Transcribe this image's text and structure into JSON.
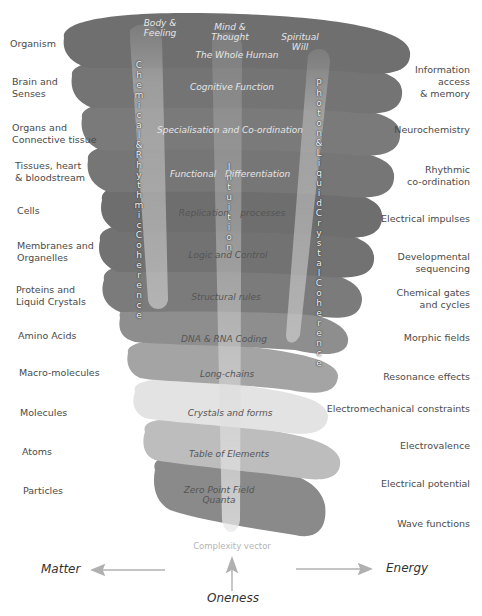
{
  "left_labels": [
    {
      "text": "Organism",
      "x": 10,
      "y": 38
    },
    {
      "text": "Brain and\nSenses",
      "x": 12,
      "y": 76
    },
    {
      "text": "Organs and\nConnective tissue",
      "x": 12,
      "y": 122
    },
    {
      "text": "Tissues, heart\n& bloodstream",
      "x": 15,
      "y": 160
    },
    {
      "text": "Cells",
      "x": 17,
      "y": 205
    },
    {
      "text": "Membranes and\nOrganelles",
      "x": 17,
      "y": 240
    },
    {
      "text": "Proteins and\nLiquid Crystals",
      "x": 16,
      "y": 284
    },
    {
      "text": "Amino Acids",
      "x": 18,
      "y": 330
    },
    {
      "text": "Macro-molecules",
      "x": 19,
      "y": 367
    },
    {
      "text": "Molecules",
      "x": 20,
      "y": 407
    },
    {
      "text": "Atoms",
      "x": 22,
      "y": 446
    },
    {
      "text": "Particles",
      "x": 23,
      "y": 485
    }
  ],
  "right_labels": [
    {
      "text": "Information\naccess\n& memory",
      "right": 12,
      "y": 64
    },
    {
      "text": "Neurochemistry",
      "right": 12,
      "y": 124
    },
    {
      "text": "Rhythmic\nco-ordination",
      "right": 12,
      "y": 164
    },
    {
      "text": "Electrical impulses",
      "right": 12,
      "y": 213
    },
    {
      "text": "Developmental\nsequencing",
      "right": 12,
      "y": 251
    },
    {
      "text": "Chemical gates\nand cycles",
      "right": 12,
      "y": 287
    },
    {
      "text": "Morphic fields",
      "right": 12,
      "y": 332
    },
    {
      "text": "Resonance effects",
      "right": 12,
      "y": 371
    },
    {
      "text": "Electromechanical constraints",
      "right": 12,
      "y": 403
    },
    {
      "text": "Electrovalence",
      "right": 12,
      "y": 440
    },
    {
      "text": "Electrical potential",
      "right": 12,
      "y": 478
    },
    {
      "text": "Wave functions",
      "right": 12,
      "y": 518
    }
  ],
  "layer_labels": [
    {
      "text": "The Whole Human",
      "x": 237,
      "y": 50,
      "tone": "light"
    },
    {
      "text": "Cognitive Function",
      "x": 232,
      "y": 82,
      "tone": "light"
    },
    {
      "text": "Specialisation and Co-ordination",
      "x": 230,
      "y": 125,
      "tone": "light"
    },
    {
      "text": "Functional   Differentiation",
      "x": 230,
      "y": 169,
      "tone": "light"
    },
    {
      "text": "Replication    processes",
      "x": 232,
      "y": 208,
      "tone": "dark"
    },
    {
      "text": "Logic and Control",
      "x": 228,
      "y": 250,
      "tone": "dark"
    },
    {
      "text": "Structural rules",
      "x": 226,
      "y": 292,
      "tone": "dark"
    },
    {
      "text": "DNA & RNA Coding",
      "x": 224,
      "y": 334,
      "tone": "dark"
    },
    {
      "text": "Long-chains",
      "x": 227,
      "y": 369,
      "tone": "dark"
    },
    {
      "text": "Crystals and forms",
      "x": 230,
      "y": 408,
      "tone": "dark"
    },
    {
      "text": "Table of Elements",
      "x": 229,
      "y": 449,
      "tone": "dark"
    },
    {
      "text": "Zero Point Field\nQuanta",
      "x": 219,
      "y": 485,
      "tone": "dark"
    }
  ],
  "top_headings": [
    {
      "text": "Body &\nFeeling",
      "x": 160,
      "y": 18
    },
    {
      "text": "Mind &\nThought",
      "x": 230,
      "y": 22
    },
    {
      "text": "Spiritual\nWill",
      "x": 300,
      "y": 32
    }
  ],
  "vertical_columns": [
    {
      "name": "chemical-rhythmic-coherence",
      "text": "Chemical & Rhythmic Coherence"
    },
    {
      "name": "intuition",
      "text": "Intuition"
    },
    {
      "name": "photon-liquid-crystal-coherence",
      "text": "Photon & Liquid Crystal Coherence"
    }
  ],
  "axis": {
    "complexity_vector": "Complexity vector",
    "left": "Matter",
    "right": "Energy",
    "bottom": "Oneness"
  },
  "colors": {
    "layer_top": "#727272",
    "layer_mid": "#7e7e7e",
    "layer_light": "#e4e4e4",
    "beam": "#b4b4b4",
    "arrow": "#b0b0b0"
  }
}
